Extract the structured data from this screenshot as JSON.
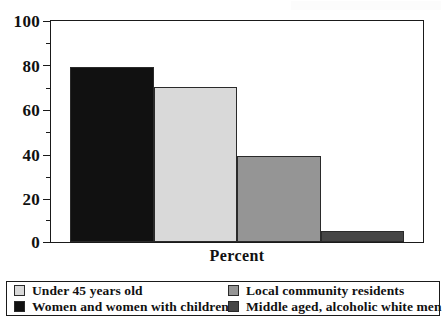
{
  "chart_data": {
    "type": "bar",
    "title": "",
    "subtitle": "",
    "xlabel": "Percent",
    "ylabel": "",
    "ylim": [
      0,
      100
    ],
    "ytick_labels": [
      "0",
      "20",
      "40",
      "60",
      "80",
      "100"
    ],
    "ytick_values": [
      0,
      20,
      40,
      60,
      80,
      100
    ],
    "yminor_tick_values": [
      10,
      30,
      50,
      70,
      90
    ],
    "grid": false,
    "legend_position": "below",
    "categories": [
      "Women and women with children",
      "Under 45 years old",
      "Local community residents",
      "Middle aged, alcoholic white men"
    ],
    "values": [
      79,
      70,
      39,
      5
    ],
    "colors": [
      "#111111",
      "#d9d9d9",
      "#959595",
      "#454545"
    ]
  },
  "axes": {
    "y_labels": [
      {
        "text": "100",
        "value": 100
      },
      {
        "text": "80",
        "value": 80
      },
      {
        "text": "60",
        "value": 60
      },
      {
        "text": "40",
        "value": 40
      },
      {
        "text": "20",
        "value": 20
      },
      {
        "text": "0",
        "value": 0
      }
    ],
    "x_title": "Percent"
  },
  "legend": {
    "entries": [
      {
        "label": "Under 45 years old",
        "color": "#d9d9d9"
      },
      {
        "label": "Local community residents",
        "color": "#959595"
      },
      {
        "label": "Women and women with children",
        "color": "#111111"
      },
      {
        "label": "Middle aged, alcoholic white men",
        "color": "#454545"
      }
    ]
  }
}
